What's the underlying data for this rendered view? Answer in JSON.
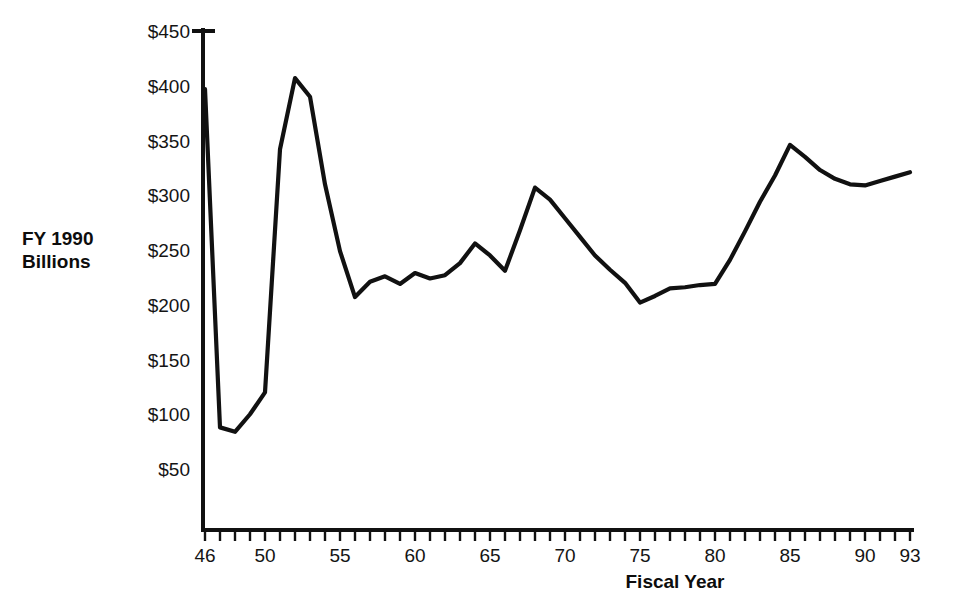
{
  "chart_data": {
    "type": "line",
    "title": "",
    "xlabel": "Fiscal Year",
    "ylabel": "FY 1990 Billions",
    "ylabel_line1": "FY 1990",
    "ylabel_line2": "Billions",
    "xlim": [
      46,
      93
    ],
    "ylim": [
      0,
      450
    ],
    "grid": false,
    "legend": null,
    "line_color": "#111111",
    "y_ticks": [
      450,
      400,
      350,
      300,
      250,
      200,
      150,
      100,
      50
    ],
    "y_tick_labels": [
      "$450",
      "$400",
      "$350",
      "$300",
      "$250",
      "$200",
      "$150",
      "$100",
      "$50"
    ],
    "x_ticks": [
      46,
      47,
      48,
      49,
      50,
      51,
      52,
      53,
      54,
      55,
      56,
      57,
      58,
      59,
      60,
      61,
      62,
      63,
      64,
      65,
      66,
      67,
      68,
      69,
      70,
      71,
      72,
      73,
      74,
      75,
      76,
      77,
      78,
      79,
      80,
      81,
      82,
      83,
      84,
      85,
      86,
      87,
      88,
      89,
      90,
      91,
      92,
      93
    ],
    "x_tick_labels": [
      {
        "value": 46,
        "label": "46"
      },
      {
        "value": 50,
        "label": "50"
      },
      {
        "value": 55,
        "label": "55"
      },
      {
        "value": 60,
        "label": "60"
      },
      {
        "value": 65,
        "label": "65"
      },
      {
        "value": 70,
        "label": "70"
      },
      {
        "value": 75,
        "label": "75"
      },
      {
        "value": 80,
        "label": "80"
      },
      {
        "value": 85,
        "label": "85"
      },
      {
        "value": 90,
        "label": "90"
      },
      {
        "value": 93,
        "label": "93"
      }
    ],
    "x": [
      46,
      47,
      48,
      49,
      50,
      51,
      52,
      53,
      54,
      55,
      56,
      57,
      58,
      59,
      60,
      61,
      62,
      63,
      64,
      65,
      66,
      67,
      68,
      69,
      70,
      71,
      72,
      73,
      74,
      75,
      76,
      77,
      78,
      79,
      80,
      81,
      82,
      83,
      84,
      85,
      86,
      87,
      88,
      89,
      90,
      91,
      92,
      93
    ],
    "values": [
      397,
      88,
      84,
      100,
      120,
      342,
      407,
      390,
      310,
      249,
      207,
      221,
      226,
      219,
      229,
      224,
      227,
      238,
      256,
      245,
      231,
      268,
      307,
      296,
      279,
      262,
      245,
      232,
      220,
      202,
      208,
      215,
      216,
      218,
      219,
      241,
      267,
      294,
      318,
      346,
      335,
      323,
      315,
      310,
      309,
      313,
      317,
      321
    ],
    "series": [
      {
        "name": "Defense Budget Authority",
        "values": [
          397,
          88,
          84,
          100,
          120,
          342,
          407,
          390,
          310,
          249,
          207,
          221,
          226,
          219,
          229,
          224,
          227,
          238,
          256,
          245,
          231,
          268,
          307,
          296,
          279,
          262,
          245,
          232,
          220,
          202,
          208,
          215,
          216,
          218,
          219,
          241,
          267,
          294,
          318,
          346,
          335,
          323,
          315,
          310,
          309,
          313,
          317,
          321
        ]
      }
    ]
  }
}
